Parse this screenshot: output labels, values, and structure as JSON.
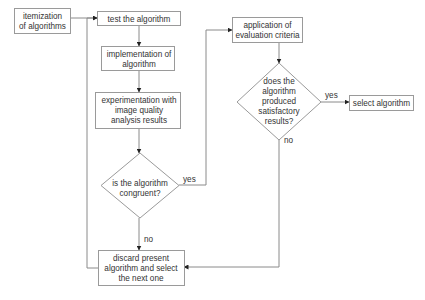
{
  "diagram": {
    "type": "flowchart",
    "colors": {
      "stroke": "#9a9a9a",
      "edge": "#8a8a8a",
      "text": "#333333",
      "arrowhead": "#222222",
      "background": "#ffffff"
    },
    "nodes": {
      "itemization": {
        "shape": "rect",
        "lines": [
          "itemization",
          "of algorithms"
        ]
      },
      "test": {
        "shape": "rect",
        "lines": [
          "test the algorithm"
        ]
      },
      "implementation": {
        "shape": "rect",
        "lines": [
          "implementation of",
          "algorithm"
        ]
      },
      "experimentation": {
        "shape": "rect",
        "lines": [
          "experimentation with",
          "image quality",
          "analysis results"
        ]
      },
      "congruent": {
        "shape": "diamond",
        "lines": [
          "is the algorithm",
          "congruent?"
        ]
      },
      "discard": {
        "shape": "rect",
        "lines": [
          "discard present",
          "algorithm and select",
          "the next one"
        ]
      },
      "application": {
        "shape": "rect",
        "lines": [
          "application of",
          "evaluation criteria"
        ]
      },
      "satisfactory": {
        "shape": "diamond",
        "lines": [
          "does the",
          "algorithm",
          "produced",
          "satisfactory",
          "results?"
        ]
      },
      "select": {
        "shape": "rect",
        "lines": [
          "select algorithm"
        ]
      }
    },
    "edges": [
      {
        "from": "itemization",
        "to": "test",
        "label": ""
      },
      {
        "from": "test",
        "to": "implementation",
        "label": ""
      },
      {
        "from": "implementation",
        "to": "experimentation",
        "label": ""
      },
      {
        "from": "experimentation",
        "to": "congruent",
        "label": ""
      },
      {
        "from": "congruent",
        "to": "discard",
        "label": "no"
      },
      {
        "from": "congruent",
        "to": "application",
        "label": "yes"
      },
      {
        "from": "discard",
        "to": "test",
        "label": ""
      },
      {
        "from": "application",
        "to": "satisfactory",
        "label": ""
      },
      {
        "from": "satisfactory",
        "to": "select",
        "label": "yes"
      },
      {
        "from": "satisfactory",
        "to": "discard",
        "label": "no"
      }
    ]
  }
}
